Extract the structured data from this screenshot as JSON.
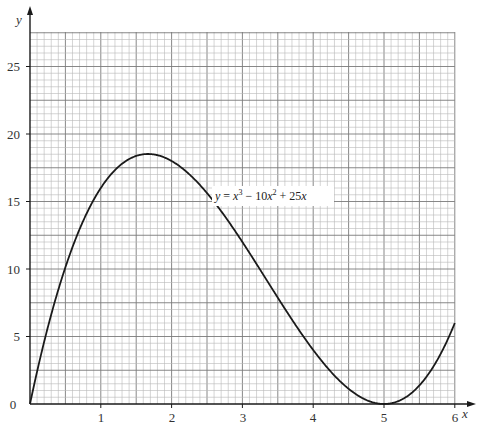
{
  "chart_data": {
    "type": "line",
    "title": "",
    "xlabel": "x",
    "ylabel": "y",
    "xlim": [
      0,
      6
    ],
    "ylim": [
      0,
      27.5
    ],
    "grid": true,
    "x_ticks": [
      1,
      2,
      3,
      4,
      5,
      6
    ],
    "y_ticks": [
      0,
      5,
      10,
      15,
      20,
      25
    ],
    "origin_label": "0",
    "series": [
      {
        "name": "y = x³ − 10x² + 25x",
        "function": "x^3 - 10x^2 + 25x",
        "x": [
          0,
          0.25,
          0.5,
          0.75,
          1,
          1.25,
          1.5,
          1.667,
          1.75,
          2,
          2.25,
          2.5,
          2.75,
          3,
          3.25,
          3.5,
          3.75,
          4,
          4.25,
          4.5,
          4.75,
          5,
          5.25,
          5.5,
          5.75,
          6
        ],
        "values": [
          0,
          5.64,
          10.13,
          13.55,
          16,
          17.58,
          18.38,
          18.52,
          18.52,
          18,
          16.92,
          15.63,
          13.7,
          12,
          9.92,
          7.88,
          5.86,
          4,
          2.39,
          1.13,
          0.3,
          0,
          0.33,
          1.38,
          3.23,
          6
        ]
      }
    ],
    "annotations": [
      {
        "text_parts": [
          "y",
          " = ",
          "x",
          "3",
          " − 10",
          "x",
          "2",
          " + 25",
          "x"
        ],
        "x": 2.45,
        "y": 15.8
      }
    ]
  },
  "labels": {
    "x_axis": "x",
    "y_axis": "y",
    "origin": "0",
    "x_ticks": [
      "1",
      "2",
      "3",
      "4",
      "5",
      "6"
    ],
    "y_ticks": [
      "5",
      "10",
      "15",
      "20",
      "25"
    ],
    "equation": {
      "y": "y",
      "eq": " = ",
      "x1": "x",
      "p1": "3",
      "minus": " − 10",
      "x2": "x",
      "p2": "2",
      "plus": " + 25",
      "x3": "x"
    }
  },
  "colors": {
    "curve": "#1a1a1a",
    "axis": "#1a1a1a",
    "grid_minor": "#b8b8b8",
    "grid_major": "#7a7a7a",
    "background": "#ffffff"
  }
}
